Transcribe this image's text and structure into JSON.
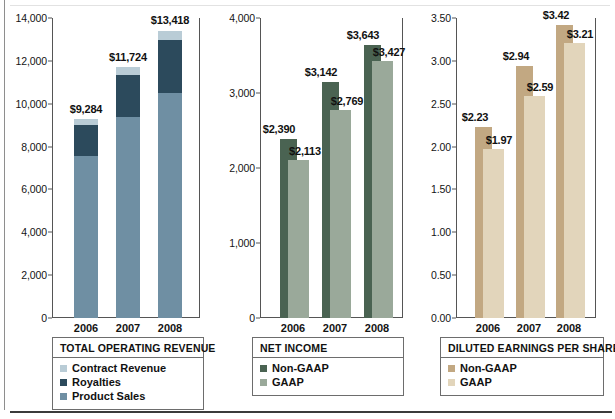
{
  "colors": {
    "contract_revenue": "#b9ccd6",
    "royalties": "#2c4a5c",
    "product_sales": "#6f8fa3",
    "non_gaap_green": "#4a6352",
    "gaap_green": "#9aa99a",
    "non_gaap_tan": "#c2a882",
    "gaap_tan": "#e2d5bb",
    "axis": "#555555",
    "rule_bottom": "#3b3b3b",
    "rule_left": "#8e8e8e"
  },
  "chart_data": [
    {
      "type": "bar",
      "id": "total-operating-revenue",
      "title": "TOTAL OPERATING REVENUE",
      "subtype": "stacked",
      "categories": [
        "2006",
        "2007",
        "2008"
      ],
      "ylim": [
        0,
        14000
      ],
      "yticks": [
        "0",
        "2,000",
        "4,000",
        "6,000",
        "8,000",
        "10,000",
        "12,000",
        "14,000"
      ],
      "ytick_values": [
        0,
        2000,
        4000,
        6000,
        8000,
        10000,
        12000,
        14000
      ],
      "grid": false,
      "xlabel": "",
      "ylabel": "",
      "series": [
        {
          "name": "Product Sales",
          "values": [
            7550,
            9380,
            10480
          ]
        },
        {
          "name": "Royalties",
          "values": [
            1450,
            1950,
            2500
          ]
        },
        {
          "name": "Contract Revenue",
          "values": [
            284,
            394,
            438
          ]
        }
      ],
      "totals": [
        9284,
        11724,
        13418
      ],
      "total_labels": [
        "$9,284",
        "$11,724",
        "$13,418"
      ],
      "legend": {
        "position": "below",
        "entries": [
          {
            "label": "Contract Revenue",
            "color": "#b9ccd6"
          },
          {
            "label": "Royalties",
            "color": "#2c4a5c"
          },
          {
            "label": "Product Sales",
            "color": "#6f8fa3"
          }
        ]
      }
    },
    {
      "type": "bar",
      "id": "net-income",
      "title": "NET INCOME",
      "subtype": "overlapping",
      "categories": [
        "2006",
        "2007",
        "2008"
      ],
      "ylim": [
        0,
        4000
      ],
      "yticks": [
        "0",
        "1,000",
        "2,000",
        "3,000",
        "4,000"
      ],
      "ytick_values": [
        0,
        1000,
        2000,
        3000,
        4000
      ],
      "grid": false,
      "xlabel": "",
      "ylabel": "",
      "series": [
        {
          "name": "Non-GAAP",
          "values": [
            2390,
            3142,
            3643
          ],
          "labels": [
            "$2,390",
            "$3,142",
            "$3,643"
          ],
          "color": "#4a6352"
        },
        {
          "name": "GAAP",
          "values": [
            2113,
            2769,
            3427
          ],
          "labels": [
            "$2,113",
            "$2,769",
            "$3,427"
          ],
          "color": "#9aa99a"
        }
      ],
      "legend": {
        "position": "below",
        "entries": [
          {
            "label": "Non-GAAP",
            "color": "#4a6352"
          },
          {
            "label": "GAAP",
            "color": "#9aa99a"
          }
        ]
      }
    },
    {
      "type": "bar",
      "id": "diluted-earnings-per-share",
      "title": "DILUTED EARNINGS PER SHARE",
      "subtype": "overlapping",
      "categories": [
        "2006",
        "2007",
        "2008"
      ],
      "ylim": [
        0,
        3.5
      ],
      "yticks": [
        "0.00",
        "0.50",
        "1.00",
        "1.50",
        "2.00",
        "2.50",
        "3.00",
        "3.50"
      ],
      "ytick_values": [
        0,
        0.5,
        1.0,
        1.5,
        2.0,
        2.5,
        3.0,
        3.5
      ],
      "grid": false,
      "xlabel": "",
      "ylabel": "",
      "series": [
        {
          "name": "Non-GAAP",
          "values": [
            2.23,
            2.94,
            3.42
          ],
          "labels": [
            "$2.23",
            "$2.94",
            "$3.42"
          ],
          "color": "#c2a882"
        },
        {
          "name": "GAAP",
          "values": [
            1.97,
            2.59,
            3.21
          ],
          "labels": [
            "$1.97",
            "$2.59",
            "$3.21"
          ],
          "color": "#e2d5bb"
        }
      ],
      "legend": {
        "position": "below",
        "entries": [
          {
            "label": "Non-GAAP",
            "color": "#c2a882"
          },
          {
            "label": "GAAP",
            "color": "#e2d5bb"
          }
        ]
      }
    }
  ]
}
